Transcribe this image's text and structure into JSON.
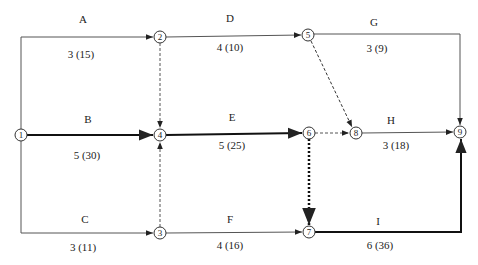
{
  "diagram": {
    "type": "activity-on-arrow network",
    "nodes": [
      {
        "id": "1",
        "x": 21,
        "y": 135
      },
      {
        "id": "2",
        "x": 160,
        "y": 37
      },
      {
        "id": "3",
        "x": 160,
        "y": 233
      },
      {
        "id": "4",
        "x": 160,
        "y": 135
      },
      {
        "id": "5",
        "x": 308,
        "y": 35
      },
      {
        "id": "6",
        "x": 309,
        "y": 133
      },
      {
        "id": "7",
        "x": 309,
        "y": 232
      },
      {
        "id": "8",
        "x": 356,
        "y": 133
      },
      {
        "id": "9",
        "x": 460,
        "y": 132
      }
    ],
    "activities": [
      {
        "name": "A",
        "detail": "3 (15)",
        "from": "1",
        "to": "2",
        "style": "normal",
        "name_pos": [
          83,
          19
        ],
        "detail_pos": [
          81,
          54
        ]
      },
      {
        "name": "B",
        "detail": "5 (30)",
        "from": "1",
        "to": "4",
        "style": "critical",
        "name_pos": [
          88,
          119
        ],
        "detail_pos": [
          87,
          155
        ]
      },
      {
        "name": "C",
        "detail": "3 (11)",
        "from": "1",
        "to": "3",
        "style": "normal",
        "name_pos": [
          85,
          219
        ],
        "detail_pos": [
          83,
          247
        ]
      },
      {
        "name": "D",
        "detail": "4 (10)",
        "from": "2",
        "to": "5",
        "style": "normal",
        "name_pos": [
          230,
          18
        ],
        "detail_pos": [
          230,
          47
        ]
      },
      {
        "name": "E",
        "detail": "5 (25)",
        "from": "4",
        "to": "6",
        "style": "critical",
        "name_pos": [
          232,
          117
        ],
        "detail_pos": [
          232,
          145
        ]
      },
      {
        "name": "F",
        "detail": "4 (16)",
        "from": "3",
        "to": "7",
        "style": "normal",
        "name_pos": [
          230,
          219
        ],
        "detail_pos": [
          230,
          245
        ]
      },
      {
        "name": "G",
        "detail": "3 (9)",
        "from": "5",
        "to": "9",
        "style": "normal",
        "name_pos": [
          374,
          22
        ],
        "detail_pos": [
          377,
          48
        ]
      },
      {
        "name": "H",
        "detail": "3 (18)",
        "from": "8",
        "to": "9",
        "style": "normal",
        "name_pos": [
          391,
          120
        ],
        "detail_pos": [
          396,
          145
        ]
      },
      {
        "name": "I",
        "detail": "6 (36)",
        "from": "7",
        "to": "9",
        "style": "critical",
        "name_pos": [
          378,
          221
        ],
        "detail_pos": [
          380,
          245
        ]
      }
    ],
    "dummies": [
      {
        "from": "2",
        "to": "4",
        "style": "dashed"
      },
      {
        "from": "3",
        "to": "4",
        "style": "dashed"
      },
      {
        "from": "5",
        "to": "8",
        "style": "dashed"
      },
      {
        "from": "6",
        "to": "8",
        "style": "dashed"
      },
      {
        "from": "6",
        "to": "7",
        "style": "critical-dotted"
      }
    ],
    "colors": {
      "line": "#555555",
      "critical": "#111111",
      "text": "#222222",
      "background": "#ffffff"
    }
  }
}
